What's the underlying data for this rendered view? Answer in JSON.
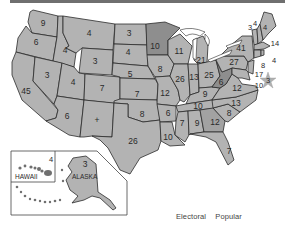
{
  "map": {
    "title": "",
    "fill_color": "#b3b3b3",
    "highlight_colors": [
      "#8e8e8e",
      "#a2a2a2"
    ],
    "border_color": "#2b2b2b",
    "electoral_votes": {
      "WA": "9",
      "OR": "6",
      "CA": "45",
      "ID": "4",
      "NV": "3",
      "MT": "4",
      "WY": "3",
      "UT": "4",
      "AZ": "6",
      "CO": "7",
      "NM": "+",
      "ND": "3",
      "SD": "4",
      "NE": "5",
      "KS": "7",
      "OK": "8",
      "TX": "26",
      "MN": "10",
      "IA": "8",
      "MO": "12",
      "AR": "6",
      "LA": "10",
      "WI": "11",
      "IL": "26",
      "MI": "21",
      "IN": "13",
      "OH": "25",
      "KY": "9",
      "TN": "10",
      "MS": "7",
      "AL": "9",
      "GA": "12",
      "FL": "7",
      "SC": "8",
      "NC": "13",
      "VA": "12",
      "WV": "6",
      "PA": "27",
      "NY": "41",
      "VT": "3",
      "NH": "4",
      "ME": "4",
      "MA": "14",
      "RI": "4",
      "CT": "8",
      "NJ": "17",
      "DE": "3",
      "MD": "10",
      "AK": "3",
      "HI": "4"
    },
    "inset": {
      "hawaii_label": "HAWAII",
      "alaska_label": "ALASKA"
    },
    "star_marker": "star-icon"
  },
  "legend": {
    "col1": "Electoral",
    "col2": "Popular"
  }
}
